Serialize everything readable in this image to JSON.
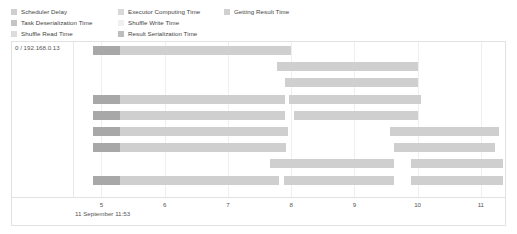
{
  "legend": {
    "columns": [
      [
        {
          "label": "Scheduler Delay",
          "color": "#cfcfcf",
          "key": "scheduler_delay"
        },
        {
          "label": "Task Deserialization Time",
          "color": "#c4c4c4",
          "key": "task_deserialization_time"
        },
        {
          "label": "Shuffle Read Time",
          "color": "#dcdcdc",
          "key": "shuffle_read_time"
        }
      ],
      [
        {
          "label": "Executor Computing Time",
          "color": "#d8d8d8",
          "key": "executor_computing_time"
        },
        {
          "label": "Shuffle Write Time",
          "color": "#f0f0f0",
          "key": "shuffle_write_time"
        },
        {
          "label": "Result Serialization Time",
          "color": "#bdbdbd",
          "key": "result_serialization_time"
        }
      ],
      [
        {
          "label": "Getting Result Time",
          "color": "#d0d0d0",
          "key": "getting_result_time"
        }
      ]
    ]
  },
  "chart_data": {
    "type": "bar",
    "title": "",
    "xlabel": "",
    "ylabel": "",
    "lane_label": "0 / 192.168.0.13",
    "timestamp_label": "11 September 11:53",
    "xlim": [
      4.55,
      11.35
    ],
    "xticks": [
      5,
      6,
      7,
      8,
      9,
      10,
      11
    ],
    "xtick_labels": [
      "5",
      "6",
      "7",
      "8",
      "9",
      "10",
      "11"
    ],
    "grid": true,
    "legend_position": "top",
    "colors": {
      "scheduler_delay": "#a8a8a8",
      "executor_computing_time": "#cfcfcf",
      "plot_background": "#ffffff",
      "border": "#e2e2e2",
      "gridline": "#efefef",
      "text": "#555555"
    },
    "rows": [
      {
        "row": 0,
        "segments": [
          {
            "key": "scheduler_delay",
            "start": 4.86,
            "end": 5.3
          },
          {
            "key": "executor_computing_time",
            "start": 5.3,
            "end": 8.0
          }
        ]
      },
      {
        "row": 1,
        "segments": [
          {
            "key": "executor_computing_time",
            "start": 7.78,
            "end": 10.01
          }
        ]
      },
      {
        "row": 2,
        "segments": [
          {
            "key": "executor_computing_time",
            "start": 7.9,
            "end": 10.0
          }
        ]
      },
      {
        "row": 3,
        "segments": [
          {
            "key": "scheduler_delay",
            "start": 4.86,
            "end": 5.3
          },
          {
            "key": "executor_computing_time",
            "start": 5.3,
            "end": 7.9
          },
          {
            "key": "executor_computing_time",
            "start": 7.97,
            "end": 10.05
          }
        ]
      },
      {
        "row": 4,
        "segments": [
          {
            "key": "scheduler_delay",
            "start": 4.86,
            "end": 5.3
          },
          {
            "key": "executor_computing_time",
            "start": 5.3,
            "end": 7.9
          },
          {
            "key": "executor_computing_time",
            "start": 8.05,
            "end": 10.0
          }
        ]
      },
      {
        "row": 5,
        "segments": [
          {
            "key": "scheduler_delay",
            "start": 4.86,
            "end": 5.3
          },
          {
            "key": "executor_computing_time",
            "start": 5.3,
            "end": 7.95
          },
          {
            "key": "executor_computing_time",
            "start": 9.57,
            "end": 11.28
          }
        ]
      },
      {
        "row": 6,
        "segments": [
          {
            "key": "scheduler_delay",
            "start": 4.86,
            "end": 5.3
          },
          {
            "key": "executor_computing_time",
            "start": 5.3,
            "end": 7.92
          },
          {
            "key": "executor_computing_time",
            "start": 9.63,
            "end": 11.23
          }
        ]
      },
      {
        "row": 7,
        "segments": [
          {
            "key": "executor_computing_time",
            "start": 7.67,
            "end": 9.62
          },
          {
            "key": "executor_computing_time",
            "start": 9.9,
            "end": 11.35
          }
        ]
      },
      {
        "row": 8,
        "segments": [
          {
            "key": "scheduler_delay",
            "start": 4.86,
            "end": 5.3
          },
          {
            "key": "executor_computing_time",
            "start": 5.3,
            "end": 7.8
          },
          {
            "key": "executor_computing_time",
            "start": 7.88,
            "end": 9.62
          },
          {
            "key": "executor_computing_time",
            "start": 9.9,
            "end": 11.35
          }
        ]
      }
    ]
  }
}
